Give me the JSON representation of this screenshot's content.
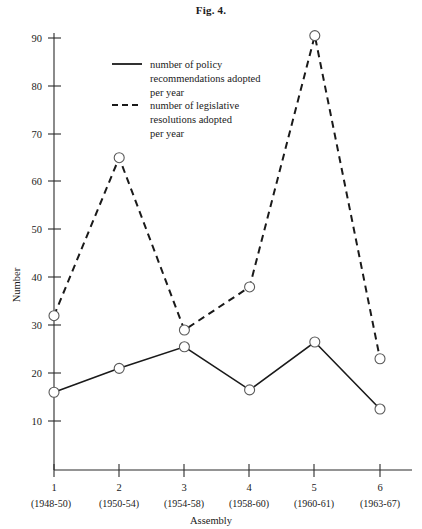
{
  "figure": {
    "title": "Fig. 4."
  },
  "chart_data": {
    "type": "line",
    "title": "Fig. 4.",
    "xlabel": "Assembly",
    "ylabel": "Number",
    "categories": [
      "1",
      "2",
      "3",
      "4",
      "5",
      "6"
    ],
    "category_subtitles": [
      "(1948-50)",
      "(1950-54)",
      "(1954-58)",
      "(1958-60)",
      "(1960-61)",
      "(1963-67)"
    ],
    "x": [
      1,
      2,
      3,
      4,
      5,
      6
    ],
    "ylim": [
      0,
      95
    ],
    "xlim": [
      0.5,
      6.6
    ],
    "yticks": [
      10,
      20,
      30,
      40,
      50,
      60,
      70,
      80,
      90
    ],
    "ytick_labels": [
      "10",
      "20",
      "30",
      "40",
      "50",
      "60",
      "70",
      "80",
      "90"
    ],
    "grid": false,
    "legend_position": "upper-left-inside",
    "series": [
      {
        "name": "number of policy recommendations adopted per year",
        "style": "solid",
        "marker": "open-circle",
        "values": [
          16,
          21,
          25.5,
          16.5,
          26.5,
          12.5
        ]
      },
      {
        "name": "number of legislative resolutions adopted per year",
        "style": "dashed",
        "marker": "open-circle",
        "values": [
          32,
          65,
          29,
          38,
          90.5,
          23
        ]
      }
    ],
    "legend": [
      {
        "style": "solid",
        "lines": [
          "number of policy",
          "recommendations adopted",
          "per year"
        ]
      },
      {
        "style": "dashed",
        "lines": [
          "number of legislative",
          "resolutions adopted",
          "per year"
        ]
      }
    ]
  }
}
